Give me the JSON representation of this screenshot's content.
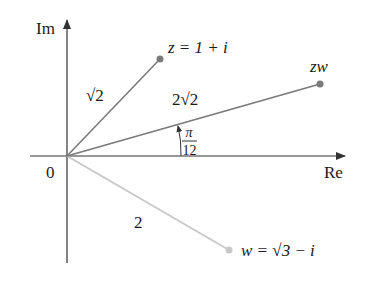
{
  "figure": {
    "axes": {
      "x_label": "Re",
      "y_label": "Im",
      "origin_label": "0"
    },
    "vectors": [
      {
        "id": "z",
        "label": "z = 1 + i",
        "modulus_label": "√2",
        "color": "#7a7a7a"
      },
      {
        "id": "zw",
        "label": "zw",
        "modulus_label": "2√2",
        "color": "#7a7a7a"
      },
      {
        "id": "w",
        "label": "w = √3 − i",
        "modulus_label": "2",
        "color": "#c8c8c8"
      }
    ],
    "angle": {
      "numerator": "π",
      "denominator": "12"
    }
  },
  "colors": {
    "axis": "#333333",
    "vector_dark": "#7a7a7a",
    "vector_light": "#c8c8c8",
    "text": "#1a1a1a"
  }
}
